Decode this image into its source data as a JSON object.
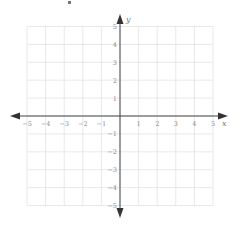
{
  "chart_data": {
    "type": "scatter",
    "title": "",
    "xlabel": "x",
    "ylabel": "y",
    "xlim": [
      -5,
      5
    ],
    "ylim": [
      -5,
      5
    ],
    "grid": true,
    "x_ticks": [
      -5,
      -4,
      -3,
      -2,
      -1,
      1,
      2,
      3,
      4,
      5
    ],
    "y_ticks": [
      5,
      4,
      3,
      2,
      1,
      -1,
      -2,
      -3,
      -4,
      -5
    ],
    "series": [],
    "annotations": []
  },
  "labels": {
    "x_axis": "x",
    "y_axis": "y",
    "x_ticks": [
      "−5",
      "−4",
      "−3",
      "−2",
      "−1",
      "1",
      "2",
      "3",
      "4",
      "5"
    ],
    "y_ticks": [
      "5",
      "4",
      "3",
      "2",
      "1",
      "−1",
      "−2",
      "−3",
      "−4",
      "−5"
    ]
  },
  "colors": {
    "grid": "#e2e2e2",
    "axis": "#444444",
    "tick_label": "#888888"
  }
}
